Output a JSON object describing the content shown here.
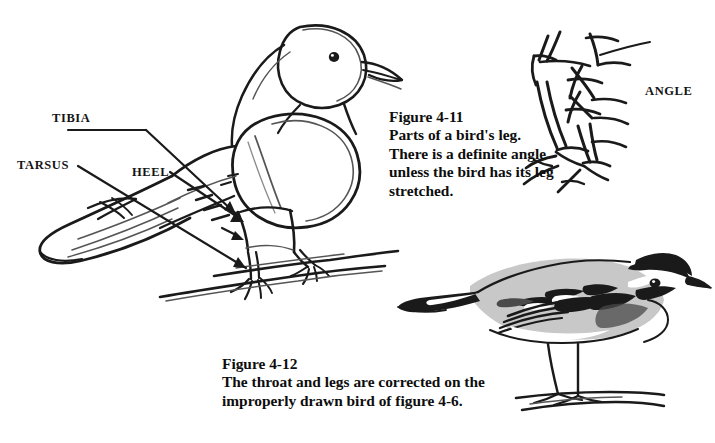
{
  "page": {
    "background": "#ffffff",
    "ink_color": "#1a1a1a",
    "width": 715,
    "height": 443
  },
  "annotations": {
    "tibia": "TIBIA",
    "tarsus": "TARSUS",
    "heel": "HEEL",
    "angle": "ANGLE"
  },
  "figures": [
    {
      "id": "figure-4-11",
      "number": "Figure 4-11",
      "caption_lines": [
        "Parts of a bird's leg.",
        "There is a definite angle",
        "unless the bird has its leg",
        "stretched."
      ]
    },
    {
      "id": "figure-4-12",
      "number": "Figure 4-12",
      "caption_lines": [
        "The throat and legs are corrected on the",
        "improperly drawn bird of figure 4-6."
      ]
    }
  ],
  "illustrations": [
    {
      "id": "perched-bird-sketch",
      "name": "pencil-sketch-perched-bird",
      "description": "Loose pencil sketch of a perched bird on two branches with leg parts labelled"
    },
    {
      "id": "leg-detail-sketch",
      "name": "bird-leg-angle-detail",
      "description": "Ink sketch detail of a bird leg showing the angle at the heel joint"
    },
    {
      "id": "warbler-drawing",
      "name": "finished-warbler-drawing",
      "description": "Finished shaded drawing of a warbler standing on a ground line"
    }
  ]
}
